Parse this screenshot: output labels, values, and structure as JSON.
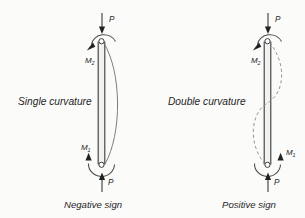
{
  "figure": {
    "background_color": "#fbfbfa",
    "stroke_color": "#3a3a3a",
    "text_color": "#1f1f1f",
    "deflection_color": "#6f6f6f"
  },
  "panels": [
    {
      "id": "left",
      "curvature_label": "Single curvature",
      "sign_label": "Negative sign",
      "deflection_style": "solid",
      "top": {
        "load_label": "P",
        "load_direction": "down",
        "moment_symbol": "M",
        "moment_subscript": "2",
        "moment_label": "M2",
        "moment_sense": "counterclockwise"
      },
      "bottom": {
        "load_label": "P",
        "load_direction": "up",
        "moment_symbol": "M",
        "moment_subscript": "1",
        "moment_label": "M1",
        "moment_sense": "counterclockwise",
        "moment_side": "left"
      }
    },
    {
      "id": "right",
      "curvature_label": "Double curvature",
      "sign_label": "Positive sign",
      "deflection_style": "dashed",
      "top": {
        "load_label": "P",
        "load_direction": "down",
        "moment_symbol": "M",
        "moment_subscript": "2",
        "moment_label": "M2",
        "moment_sense": "counterclockwise"
      },
      "bottom": {
        "load_label": "P",
        "load_direction": "up",
        "moment_symbol": "M",
        "moment_subscript": "1",
        "moment_label": "M1",
        "moment_sense": "clockwise",
        "moment_side": "right"
      }
    }
  ]
}
